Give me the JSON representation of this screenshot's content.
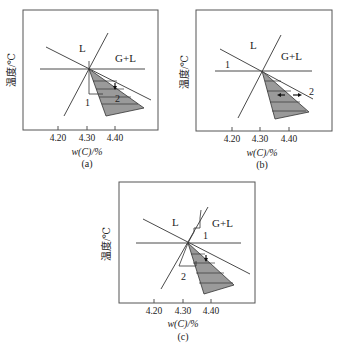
{
  "figure": {
    "panels": [
      {
        "id": "a",
        "caption": "(a)",
        "ylabel": "温度/℃",
        "xlabel": "w(C)/%",
        "xticks": [
          "4.20",
          "4.30",
          "4.40"
        ],
        "region_labels": {
          "liquid": "L",
          "gas_liquid": "G+L"
        },
        "path_labels": {
          "path1": "1",
          "path2": "2"
        }
      },
      {
        "id": "b",
        "caption": "(b)",
        "ylabel": "温度/℃",
        "xlabel": "w(C)/%",
        "xticks": [
          "4.20",
          "4.30",
          "4.40"
        ],
        "region_labels": {
          "liquid": "L",
          "gas_liquid": "G+L"
        },
        "path_labels": {
          "path1": "1",
          "path2": "2"
        }
      },
      {
        "id": "c",
        "caption": "(c)",
        "ylabel": "温度/℃",
        "xlabel": "w(C)/%",
        "xticks": [
          "4.20",
          "4.30",
          "4.40"
        ],
        "region_labels": {
          "liquid": "L",
          "gas_liquid": "G+L"
        },
        "path_labels": {
          "path1": "1",
          "path2": "2"
        }
      }
    ],
    "colors": {
      "line": "#4a4a4a",
      "shade": "#9a9a9a",
      "frame": "#555555"
    }
  }
}
